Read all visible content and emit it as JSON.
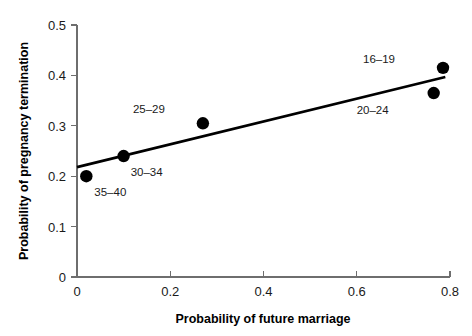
{
  "chart_data": {
    "type": "scatter",
    "title": "",
    "xlabel": "Probability of future marriage",
    "ylabel": "Probability of pregnancy termination",
    "xlim": [
      0,
      0.8
    ],
    "ylim": [
      0,
      0.5
    ],
    "grid": false,
    "legend": "none",
    "xticks": [
      "0",
      "0.2",
      "0.4",
      "0.6",
      "0.8"
    ],
    "xtick_values": [
      0,
      0.2,
      0.4,
      0.6,
      0.8
    ],
    "yticks": [
      "0",
      "0.1",
      "0.2",
      "0.3",
      "0.4",
      "0.5"
    ],
    "ytick_values": [
      0,
      0.1,
      0.2,
      0.3,
      0.4,
      0.5
    ],
    "points": [
      {
        "label": "35–40",
        "x": 0.02,
        "y": 0.2,
        "label_dx": 8,
        "label_dy": 20
      },
      {
        "label": "30–34",
        "x": 0.1,
        "y": 0.24,
        "label_dx": 7,
        "label_dy": 20
      },
      {
        "label": "25–29",
        "x": 0.27,
        "y": 0.305,
        "label_dx": -38,
        "label_dy": -10
      },
      {
        "label": "20–24",
        "x": 0.765,
        "y": 0.365,
        "label_dx": -45,
        "label_dy": 21
      },
      {
        "label": "16–19",
        "x": 0.785,
        "y": 0.415,
        "label_dx": -48,
        "label_dy": -5
      }
    ],
    "trend_line": {
      "name": "fitted regression line",
      "x0": 0.0,
      "y0": 0.218,
      "x1": 0.79,
      "y1": 0.397
    }
  }
}
